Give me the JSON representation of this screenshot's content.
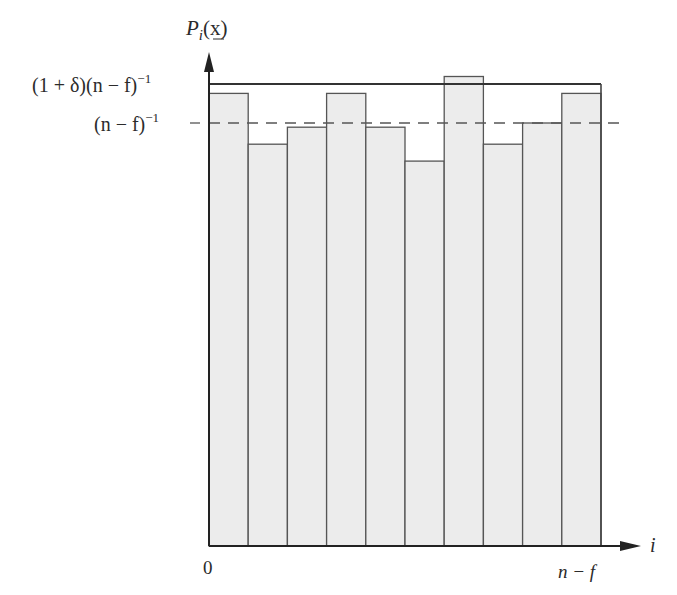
{
  "chart_data": {
    "type": "bar",
    "title": "",
    "ylabel": "P_i(x)",
    "xlabel": "i",
    "x_tick_start": "0",
    "x_tick_end": "n − f",
    "categories": [
      "1",
      "2",
      "3",
      "4",
      "5",
      "6",
      "7",
      "8",
      "9",
      "10"
    ],
    "values": [
      1.07,
      0.95,
      0.99,
      1.07,
      0.99,
      0.91,
      1.11,
      0.95,
      1.0,
      1.07
    ],
    "value_units": "multiples of (n − f)^-1",
    "reference_lines": [
      {
        "label": "(1 + δ)(n − f)^-1",
        "value": 1.28,
        "style": "solid"
      },
      {
        "label": "(n − f)^-1",
        "value": 1.0,
        "style": "dashed"
      }
    ],
    "ylim": [
      0,
      1.6
    ],
    "grid": false,
    "legend": "none"
  },
  "labels": {
    "y_axis_P": "P",
    "y_axis_sub": "i",
    "y_axis_arg": "(x)",
    "upper_bound_a": "(1 + δ)(n − f)",
    "upper_bound_exp": "−1",
    "mean_a": "(n − f)",
    "mean_exp": "−1",
    "x_axis": "i",
    "x_start": "0",
    "x_end": "n − f"
  },
  "colors": {
    "bar_fill": "#ececec",
    "bar_stroke": "#555555",
    "axis": "#222222"
  }
}
